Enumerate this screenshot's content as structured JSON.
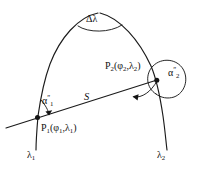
{
  "figure": {
    "background_color": "#ffffff",
    "ink_color": "#1b1b1b",
    "width": 198,
    "height": 174
  },
  "labels": {
    "delta_lambda": "Δλ",
    "point2": "P",
    "point2_sub": "2",
    "point2_coords_open": "(φ",
    "point2_coords_sub1": "2",
    "point2_coords_mid": ",λ",
    "point2_coords_sub2": "2",
    "point2_coords_close": ")",
    "alpha2": "α",
    "alpha2_sub": "2",
    "alpha2_prime": "″",
    "geodesic_length": "S",
    "alpha1": "α",
    "alpha1_sub": "1",
    "alpha1_prime": "″",
    "point1": "P",
    "point1_sub": "1",
    "point1_coords_open": "(φ",
    "point1_coords_sub1": "1",
    "point1_coords_mid": ",λ",
    "point1_coords_sub2": "1",
    "point1_coords_close": ")",
    "lambda1": "λ",
    "lambda1_sub": "1",
    "lambda2": "λ",
    "lambda2_sub": "2"
  },
  "elements": {
    "meridian_left_name": "meridian-lambda1",
    "meridian_right_name": "meridian-lambda2",
    "geodesic_name": "geodesic-line-S",
    "apex_arc_name": "delta-lambda-arc",
    "alpha1_arc_name": "alpha1-angle-arc",
    "alpha2_arc_name": "alpha2-angle-arc",
    "azimuth_arc_name": "azimuth-arc-at-p2"
  }
}
